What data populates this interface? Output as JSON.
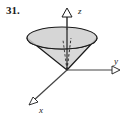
{
  "figure": {
    "number_label": "31.",
    "caption": ""
  },
  "axes": {
    "z": {
      "label": "z",
      "direction": "up",
      "label_x": 78,
      "label_y": 13
    },
    "y": {
      "label": "y",
      "direction": "right",
      "label_x": 115,
      "label_y": 64
    },
    "x": {
      "label": "x",
      "direction": "down-left",
      "label_x": 38,
      "label_y": 112
    }
  },
  "colors": {
    "stroke": "#1a1a1a",
    "axis": "#444444",
    "cone_fill": "#d8d8d8",
    "cone_top_fill": "#cfcfcf",
    "background": "#ffffff"
  },
  "geometry": {
    "origin": {
      "x": 67,
      "y": 70
    },
    "cone_top_ellipse": {
      "cx": 62,
      "cy": 38,
      "rx": 35,
      "ry": 11
    },
    "z_axis_top": {
      "x": 67,
      "y": 16
    },
    "y_axis_end": {
      "x": 116,
      "y": 70
    },
    "x_axis_end": {
      "x": 31,
      "y": 103
    }
  }
}
